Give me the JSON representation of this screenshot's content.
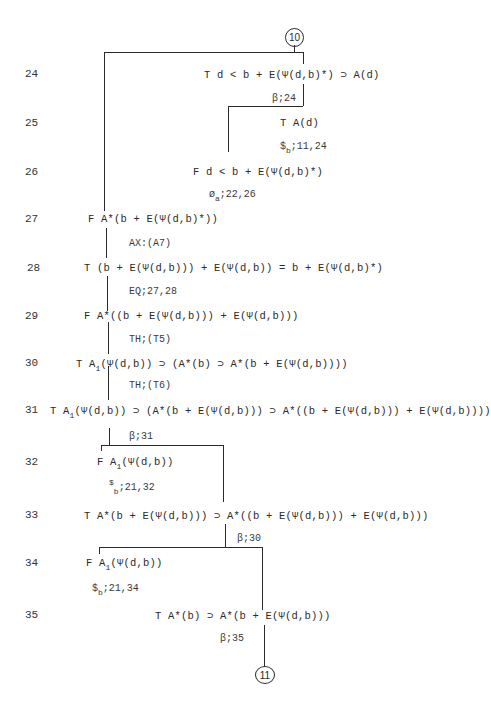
{
  "page": {
    "top_connector": "10",
    "bottom_connector": "11"
  },
  "rows": [
    {
      "n": "24",
      "sign": "T",
      "formula": "d < b + E(Ψ(d,b)*) ⊃ A(d)"
    },
    {
      "n": "25",
      "sign": "T",
      "formula": "A(d)"
    },
    {
      "n": "26",
      "sign": "F",
      "formula": "d < b + E(Ψ(d,b)*)"
    },
    {
      "n": "27",
      "sign": "F",
      "formula": "A*(b + E(Ψ(d,b)*))"
    },
    {
      "n": "28",
      "sign": "T",
      "formula": "(b + E(Ψ(d,b))) + E(Ψ(d,b)) = b +  E(Ψ(d,b)*)"
    },
    {
      "n": "29",
      "sign": "F",
      "formula": "A*((b + E(Ψ(d,b))) + E(Ψ(d,b)))"
    },
    {
      "n": "30",
      "sign": "T",
      "pre": "A",
      "sub": "1",
      "formula": "(Ψ(d,b)) ⊃ (A*(b) ⊃ A*(b + E(Ψ(d,b))))"
    },
    {
      "n": "31",
      "sign": "T",
      "pre": "A",
      "sub": "1",
      "formula": "(Ψ(d,b)) ⊃ (A*(b + E(Ψ(d,b))) ⊃ A*((b + E(Ψ(d,b))) + E(Ψ(d,b))))"
    },
    {
      "n": "32",
      "sign": "F",
      "pre": "A",
      "sub": "1",
      "formula": "(Ψ(d,b))"
    },
    {
      "n": "33",
      "sign": "T",
      "formula": "A*(b + E(Ψ(d,b))) ⊃ A*((b + E(Ψ(d,b))) + E(Ψ(d,b)))"
    },
    {
      "n": "34",
      "sign": "F",
      "pre": "A",
      "sub": "1",
      "formula": "(Ψ(d,b))"
    },
    {
      "n": "35",
      "sign": "T",
      "formula": "A*(b) ⊃ A*(b + E(Ψ(d,b)))"
    }
  ],
  "justifications": [
    {
      "id": "j24",
      "text": "β;24"
    },
    {
      "id": "j25",
      "sym": "$",
      "sub": "b",
      "text": ";11,24"
    },
    {
      "id": "j26",
      "sym": "ø",
      "sub": "a",
      "text": ";22,26"
    },
    {
      "id": "j27",
      "text": "AX:(A7)"
    },
    {
      "id": "j28",
      "text": "EQ;27,28"
    },
    {
      "id": "j29",
      "text": "TH;(T5)"
    },
    {
      "id": "j30",
      "text": "TH;(T6)"
    },
    {
      "id": "j31",
      "text": "β;31"
    },
    {
      "id": "j32",
      "sym": "$",
      "sub": "b",
      "text": ";21,32"
    },
    {
      "id": "j33",
      "text": "β;30"
    },
    {
      "id": "j34",
      "sym": "$",
      "sub": "b",
      "text": ";21,34"
    },
    {
      "id": "j35",
      "text": "β;35"
    }
  ]
}
